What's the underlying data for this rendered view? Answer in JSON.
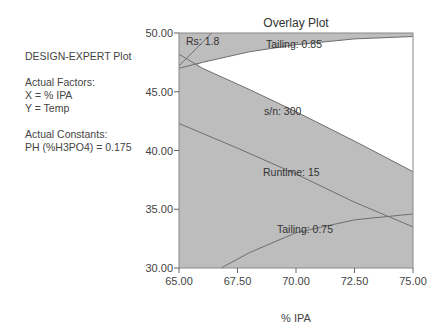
{
  "info_panel": {
    "heading": "DESIGN-EXPERT Plot",
    "factors_label": "Actual Factors:",
    "x_factor": "X = % IPA",
    "y_factor": "Y = Temp",
    "constants_label": "Actual Constants:",
    "constant": "PH (%H3PO4) = 0.175"
  },
  "chart_data": {
    "type": "overlay-contour",
    "title": "Overlay Plot",
    "xlabel": "% IPA",
    "ylabel": "",
    "xlim": [
      65.0,
      75.0
    ],
    "ylim": [
      30.0,
      50.0
    ],
    "x_ticks": [
      "65.00",
      "67.50",
      "70.00",
      "72.50",
      "75.00"
    ],
    "y_ticks": [
      "30.00",
      "35.00",
      "40.00",
      "45.00",
      "50.00"
    ],
    "grid": false,
    "legend": null,
    "shaded_color": "#bdbdbd",
    "line_color": "#6e6e6e",
    "contours": [
      {
        "name": "Rs",
        "label": "Rs: 1.8",
        "points": [
          [
            65.0,
            47.2
          ],
          [
            66.4,
            50.0
          ]
        ]
      },
      {
        "name": "Tailing (upper)",
        "label": "Tailing: 0.85",
        "points": [
          [
            65.0,
            47.0
          ],
          [
            66.0,
            47.5
          ],
          [
            68.0,
            48.4
          ],
          [
            70.0,
            49.0
          ],
          [
            72.5,
            49.5
          ],
          [
            75.0,
            49.7
          ]
        ]
      },
      {
        "name": "s/n",
        "label": "s/n: 300",
        "points": [
          [
            65.0,
            48.2
          ],
          [
            66.0,
            47.0
          ],
          [
            68.0,
            45.2
          ],
          [
            70.0,
            43.3
          ],
          [
            72.5,
            40.8
          ],
          [
            75.0,
            38.2
          ]
        ]
      },
      {
        "name": "Runtime",
        "label": "Runtime: 15",
        "points": [
          [
            65.0,
            42.3
          ],
          [
            67.5,
            40.2
          ],
          [
            70.0,
            38.0
          ],
          [
            72.5,
            35.6
          ],
          [
            75.0,
            33.5
          ]
        ]
      },
      {
        "name": "Tailing (lower)",
        "label": "Tailing: 0.75",
        "points": [
          [
            66.8,
            30.0
          ],
          [
            68.0,
            31.3
          ],
          [
            70.0,
            33.0
          ],
          [
            72.5,
            34.1
          ],
          [
            75.0,
            34.6
          ]
        ]
      }
    ],
    "feasible_region": "white (unshaded) region bounded above by Tailing 0.85 and below by s/n 300, right side to 75.00"
  }
}
